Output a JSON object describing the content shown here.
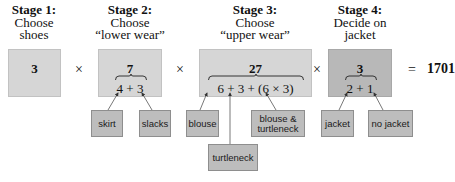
{
  "stages": [
    {
      "title": "Stage 1:",
      "line1": "Choose",
      "line2": "shoes",
      "total": "3",
      "sum": ""
    },
    {
      "title": "Stage 2:",
      "line1": "Choose",
      "line2": "“lower wear”",
      "total": "7",
      "sum": "4 + 3"
    },
    {
      "title": "Stage 3:",
      "line1": "Choose",
      "line2": "“upper wear”",
      "total": "27",
      "sum": "6 + 3 + (6 × 3)"
    },
    {
      "title": "Stage 4:",
      "line1": "Decide on",
      "line2": "jacket",
      "total": "3",
      "sum": "2 + 1"
    }
  ],
  "operators": {
    "multiply": "×",
    "equals": "="
  },
  "result": "1701",
  "options": {
    "skirt": "skirt",
    "slacks": "slacks",
    "blouse": "blouse",
    "turtleneck": "turtleneck",
    "blouse_turtleneck_1": "blouse &",
    "blouse_turtleneck_2": "turtleneck",
    "jacket": "jacket",
    "no_jacket": "no jacket"
  },
  "colors": {
    "light_box": "#d6d6d6",
    "dark_box": "#b8b8b8",
    "option_box": "#bdbdbd"
  }
}
